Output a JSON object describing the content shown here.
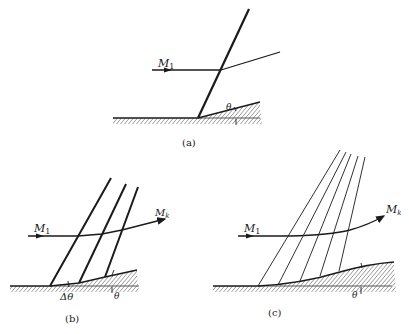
{
  "figure": {
    "panels": [
      {
        "id": "a",
        "caption": "(a)",
        "description": "Oblique shock at concave corner",
        "labels": {
          "mach_in": "M",
          "mach_in_sub": "1",
          "angle": "θ"
        }
      },
      {
        "id": "b",
        "caption": "(b)",
        "description": "Series of weak compression waves at gradual turns",
        "labels": {
          "mach_in": "M",
          "mach_in_sub": "1",
          "mach_out": "M",
          "mach_out_sub": "k",
          "delta_angle": "Δθ",
          "angle": "θ"
        }
      },
      {
        "id": "c",
        "caption": "(c)",
        "description": "Isentropic compression on smooth concave wall with converging Mach waves",
        "labels": {
          "mach_in": "M",
          "mach_in_sub": "1",
          "mach_out": "M",
          "mach_out_sub": "k",
          "angle": "θ"
        }
      }
    ],
    "colors": {
      "ink": "#1a1a1a",
      "background": "#ffffff"
    }
  }
}
